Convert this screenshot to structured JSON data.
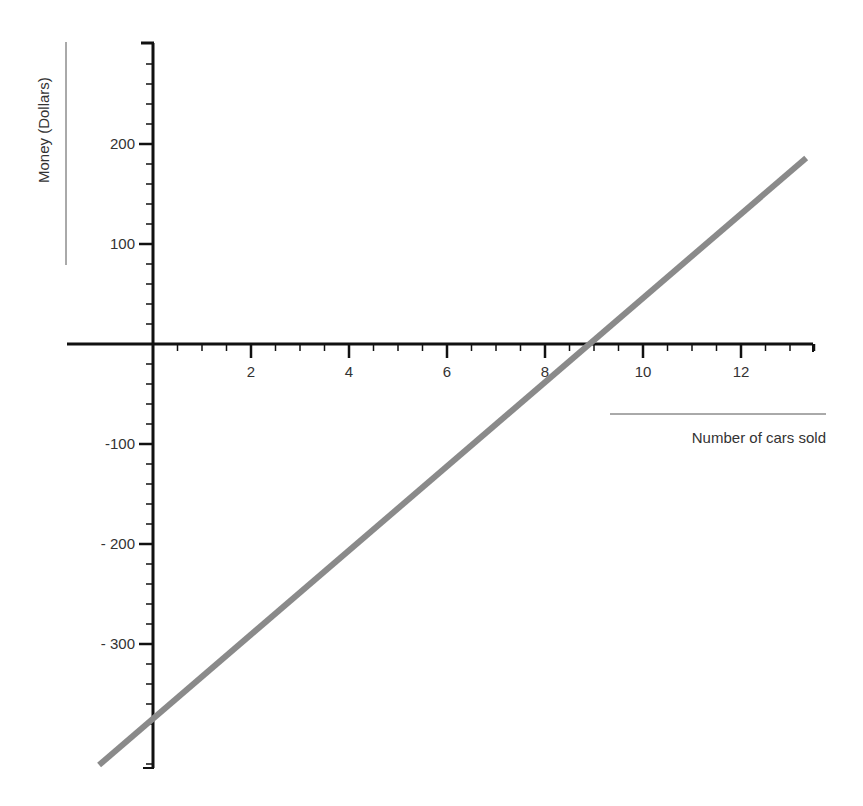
{
  "chart_data": {
    "type": "line",
    "title": "",
    "xlabel": "Number of cars sold",
    "ylabel": "Money (Dollars)",
    "xlim": [
      -1.75,
      13.5
    ],
    "ylim": [
      -424,
      300
    ],
    "grid": false,
    "legend": null,
    "x_ticks": [
      2,
      4,
      6,
      8,
      10,
      12
    ],
    "x_tick_labels": [
      "2",
      "4",
      "6",
      "8",
      "10",
      "12"
    ],
    "x_minor_step": 0.5,
    "y_ticks": [
      200,
      100,
      -100,
      -200,
      -300
    ],
    "y_tick_labels": [
      "200",
      "100",
      "-100",
      "- 200",
      "- 300"
    ],
    "y_minor_step": 20,
    "series": [
      {
        "name": "Profit line",
        "color": "#8a8a8a",
        "x": [
          -1.1,
          0,
          8.85,
          13.33
        ],
        "y": [
          -421,
          -368,
          0,
          186
        ]
      }
    ],
    "annotations": {
      "slope_estimate": 41.5,
      "y_intercept_estimate": -368,
      "x_intercept_estimate": 8.85
    }
  },
  "colors": {
    "axis": "#111111",
    "line": "#8a8a8a",
    "text": "#333333",
    "label_rule": "#555555"
  }
}
